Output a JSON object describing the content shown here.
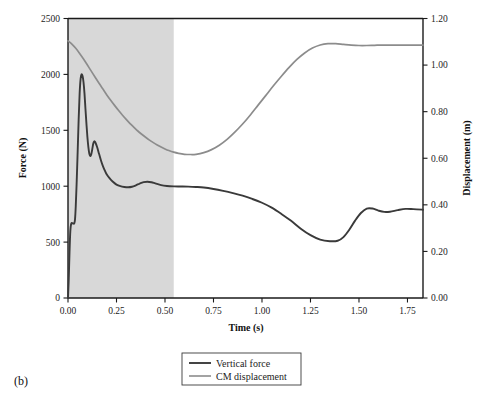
{
  "figure": {
    "panel_label": "(b)",
    "background_color": "#ffffff"
  },
  "legend": {
    "items": [
      {
        "label": "Vertical force",
        "color": "#3a3a3a"
      },
      {
        "label": "CM displacement",
        "color": "#8c8c8c"
      }
    ]
  },
  "chart_data": {
    "type": "line",
    "title": "",
    "xlabel": "Time (s)",
    "ylabel": "Force (N)",
    "y2label": "Displacement (m)",
    "xlim": [
      0.0,
      1.83
    ],
    "ylim": [
      0,
      2500
    ],
    "y2lim": [
      0.0,
      1.2
    ],
    "grid": false,
    "legend_position": "below-center",
    "xticks": [
      0.0,
      0.25,
      0.5,
      0.75,
      1.0,
      1.25,
      1.5,
      1.75
    ],
    "xticklabels": [
      "0.00",
      "0.25",
      "0.50",
      "0.75",
      "1.00",
      "1.25",
      "1.50",
      "1.75"
    ],
    "yticks": [
      0,
      500,
      1000,
      1500,
      2000,
      2500
    ],
    "yticklabels": [
      "0",
      "500",
      "1000",
      "1500",
      "2000",
      "2500"
    ],
    "y2ticks": [
      0.0,
      0.2,
      0.4,
      0.6,
      0.8,
      1.0,
      1.2
    ],
    "y2ticklabels": [
      "0.00",
      "0.20",
      "0.40",
      "0.60",
      "0.80",
      "1.00",
      "1.20"
    ],
    "shaded_region": {
      "x_start": 0.0,
      "x_end": 0.545,
      "color": "#d8d8d8"
    },
    "series": [
      {
        "name": "Vertical force",
        "axis": "left",
        "units": "N",
        "color": "#3a3a3a",
        "x": [
          0.0,
          0.004,
          0.008,
          0.012,
          0.016,
          0.02,
          0.024,
          0.028,
          0.032,
          0.036,
          0.04,
          0.045,
          0.05,
          0.055,
          0.06,
          0.065,
          0.07,
          0.075,
          0.08,
          0.085,
          0.09,
          0.095,
          0.1,
          0.105,
          0.11,
          0.115,
          0.12,
          0.125,
          0.13,
          0.135,
          0.14,
          0.15,
          0.16,
          0.17,
          0.18,
          0.19,
          0.2,
          0.215,
          0.23,
          0.25,
          0.27,
          0.29,
          0.31,
          0.33,
          0.35,
          0.37,
          0.39,
          0.41,
          0.43,
          0.45,
          0.48,
          0.51,
          0.545,
          0.58,
          0.62,
          0.66,
          0.7,
          0.75,
          0.8,
          0.85,
          0.9,
          0.95,
          1.0,
          1.05,
          1.1,
          1.15,
          1.2,
          1.25,
          1.3,
          1.35,
          1.39,
          1.42,
          1.45,
          1.48,
          1.51,
          1.54,
          1.57,
          1.6,
          1.63,
          1.66,
          1.7,
          1.74,
          1.78,
          1.83
        ],
        "y": [
          0,
          180,
          420,
          600,
          660,
          672,
          668,
          665,
          668,
          700,
          820,
          1050,
          1320,
          1600,
          1830,
          1960,
          2000,
          1985,
          1930,
          1830,
          1690,
          1560,
          1440,
          1350,
          1290,
          1270,
          1285,
          1330,
          1380,
          1400,
          1395,
          1350,
          1290,
          1230,
          1180,
          1140,
          1105,
          1070,
          1042,
          1014,
          1000,
          993,
          990,
          995,
          1008,
          1024,
          1036,
          1040,
          1035,
          1025,
          1010,
          1002,
          998,
          997,
          996,
          993,
          988,
          975,
          958,
          938,
          915,
          886,
          852,
          808,
          752,
          690,
          620,
          562,
          522,
          508,
          512,
          545,
          610,
          692,
          760,
          800,
          800,
          782,
          770,
          772,
          786,
          797,
          795,
          790
        ]
      },
      {
        "name": "CM displacement",
        "axis": "right",
        "units": "m",
        "color": "#8c8c8c",
        "x": [
          0.0,
          0.02,
          0.04,
          0.06,
          0.08,
          0.1,
          0.12,
          0.14,
          0.16,
          0.18,
          0.2,
          0.22,
          0.24,
          0.26,
          0.28,
          0.3,
          0.32,
          0.34,
          0.36,
          0.38,
          0.4,
          0.42,
          0.44,
          0.46,
          0.48,
          0.5,
          0.52,
          0.545,
          0.57,
          0.6,
          0.63,
          0.66,
          0.7,
          0.74,
          0.78,
          0.82,
          0.86,
          0.9,
          0.94,
          0.98,
          1.02,
          1.06,
          1.1,
          1.14,
          1.18,
          1.22,
          1.26,
          1.3,
          1.34,
          1.38,
          1.42,
          1.46,
          1.5,
          1.54,
          1.58,
          1.62,
          1.66,
          1.7,
          1.75,
          1.83
        ],
        "y": [
          1.104,
          1.09,
          1.072,
          1.05,
          1.026,
          1.0,
          0.974,
          0.948,
          0.922,
          0.897,
          0.872,
          0.849,
          0.827,
          0.806,
          0.786,
          0.767,
          0.749,
          0.733,
          0.717,
          0.703,
          0.69,
          0.678,
          0.667,
          0.657,
          0.648,
          0.64,
          0.633,
          0.626,
          0.621,
          0.617,
          0.616,
          0.617,
          0.624,
          0.637,
          0.656,
          0.681,
          0.712,
          0.747,
          0.786,
          0.828,
          0.87,
          0.912,
          0.952,
          0.99,
          1.024,
          1.052,
          1.073,
          1.086,
          1.092,
          1.092,
          1.089,
          1.086,
          1.084,
          1.084,
          1.085,
          1.086,
          1.086,
          1.086,
          1.086,
          1.086
        ]
      }
    ]
  }
}
